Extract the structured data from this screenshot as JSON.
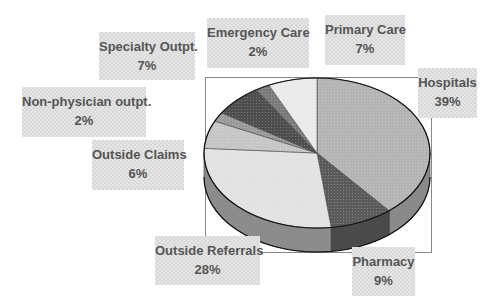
{
  "chart_data": {
    "type": "pie",
    "style": "3d",
    "title": "",
    "start_angle_deg": 90,
    "direction": "clockwise",
    "categories": [
      "Hospitals",
      "Pharmacy",
      "Outside Referrals",
      "Outside Claims",
      "Non-physician outpt.",
      "Specialty Outpt.",
      "Emergency Care",
      "Primary Care"
    ],
    "values": [
      39,
      9,
      28,
      6,
      2,
      7,
      2,
      7
    ],
    "unit": "%",
    "slices": [
      {
        "label": "Hospitals",
        "value": 39,
        "display": "39%",
        "color": "#b4b4b4",
        "side_color": "#8a8a8a"
      },
      {
        "label": "Pharmacy",
        "value": 9,
        "display": "9%",
        "color": "#5a5a5a",
        "side_color": "#4a4a4a"
      },
      {
        "label": "Outside Referrals",
        "value": 28,
        "display": "28%",
        "color": "#e2e2e2",
        "side_color": "#8c8c8c"
      },
      {
        "label": "Outside Claims",
        "value": 6,
        "display": "6%",
        "color": "#c6c6c6",
        "side_color": "#808080"
      },
      {
        "label": "Non-physician outpt.",
        "value": 2,
        "display": "2%",
        "color": "#9a9a9a",
        "side_color": "#707070"
      },
      {
        "label": "Specialty Outpt.",
        "value": 7,
        "display": "7%",
        "color": "#4e4e4e",
        "side_color": "#404040"
      },
      {
        "label": "Emergency Care",
        "value": 2,
        "display": "2%",
        "color": "#7a7a7a",
        "side_color": "#5a5a5a"
      },
      {
        "label": "Primary Care",
        "value": 7,
        "display": "7%",
        "color": "#eaeaea",
        "side_color": "#9a9a9a"
      }
    ],
    "legend": "none",
    "data_labels": "outside boxed (name + percent)"
  },
  "labels": {
    "hospitals": {
      "name": "Hospitals",
      "pct": "39%"
    },
    "pharmacy": {
      "name": "Pharmacy",
      "pct": "9%"
    },
    "outside_referrals": {
      "name": "Outside Referrals",
      "pct": "28%"
    },
    "outside_claims": {
      "name": "Outside Claims",
      "pct": "6%"
    },
    "non_physician": {
      "name": "Non-physician outpt.",
      "pct": "2%"
    },
    "specialty": {
      "name": "Specialty Outpt.",
      "pct": "7%"
    },
    "emergency": {
      "name": "Emergency Care",
      "pct": "2%"
    },
    "primary_care": {
      "name": "Primary Care",
      "pct": "7%"
    }
  }
}
